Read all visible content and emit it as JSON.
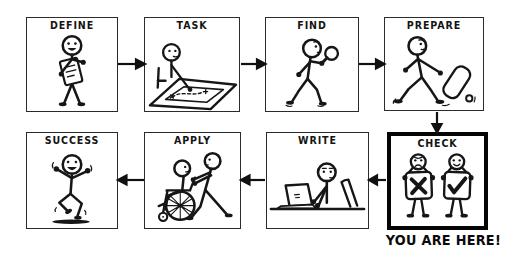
{
  "page": {
    "background": "#ffffff",
    "ink": "#161616",
    "highlight_border": "#050505"
  },
  "flowchart": {
    "you_are_here_label": "YOU ARE HERE!",
    "flow_order": [
      "DEFINE",
      "TASK",
      "FIND",
      "PREPARE",
      "CHECK",
      "WRITE",
      "APPLY",
      "SUCCESS"
    ],
    "panels": [
      {
        "id": "define",
        "label": "DEFINE",
        "illustration": "stick-figure-reading-document",
        "highlighted": false
      },
      {
        "id": "task",
        "label": "TASK",
        "illustration": "stick-figure-plotting-route-on-map",
        "highlighted": false
      },
      {
        "id": "find",
        "label": "FIND",
        "illustration": "stick-figure-with-magnifying-glass",
        "highlighted": false
      },
      {
        "id": "prepare",
        "label": "PREPARE",
        "illustration": "stick-figure-pulling-suitcase",
        "highlighted": false
      },
      {
        "id": "check",
        "label": "CHECK",
        "illustration": "stick-figures-holding-x-and-check-signs",
        "highlighted": true
      },
      {
        "id": "write",
        "label": "WRITE",
        "illustration": "stick-figure-typing-on-laptop",
        "highlighted": false
      },
      {
        "id": "apply",
        "label": "APPLY",
        "illustration": "stick-figure-pushing-wheelchair",
        "highlighted": false
      },
      {
        "id": "success",
        "label": "SUCCESS",
        "illustration": "stick-figure-celebrating",
        "highlighted": false
      }
    ]
  }
}
